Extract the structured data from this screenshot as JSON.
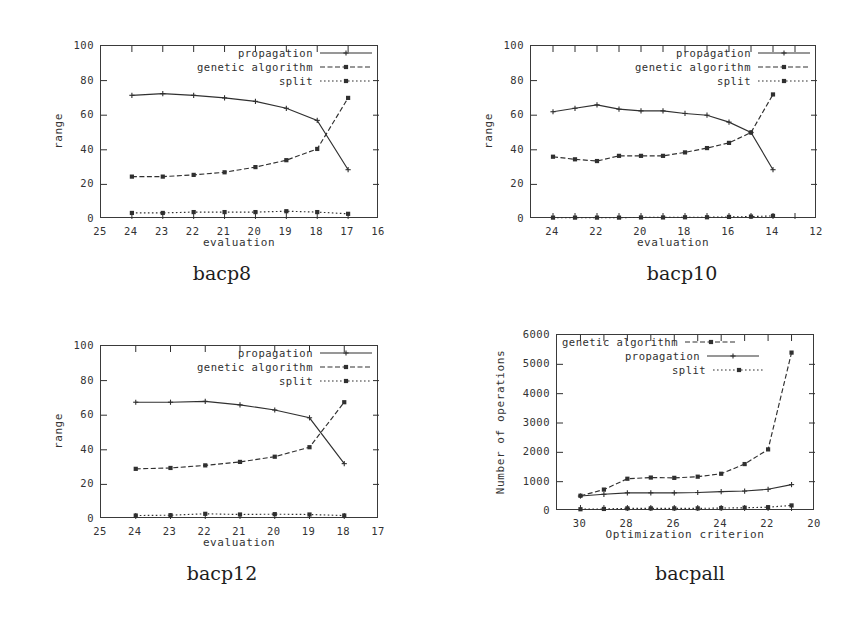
{
  "figure": {
    "background": "#ffffff",
    "ink": "#303030"
  },
  "series_styles": {
    "propagation": {
      "dash": "none",
      "marker": "plus"
    },
    "genetic algorithm": {
      "dash": "dashed",
      "marker": "square"
    },
    "split": {
      "dash": "dotted",
      "marker": "square"
    }
  },
  "panels": [
    {
      "id": "bacp8",
      "caption": "bacp8",
      "legend": [
        "propagation",
        "genetic algorithm",
        "split"
      ],
      "chart_data": {
        "type": "line",
        "title": "bacp8",
        "xlabel": "evaluation",
        "ylabel": "range",
        "xlim": [
          25,
          16
        ],
        "ylim": [
          0,
          100
        ],
        "xticks": [
          25,
          24,
          23,
          22,
          21,
          20,
          19,
          18,
          17,
          16
        ],
        "yticks": [
          0,
          20,
          40,
          60,
          80,
          100
        ],
        "x": [
          24,
          23,
          22,
          21,
          20,
          19,
          18,
          17
        ],
        "grid": false,
        "legend_position": "top-right",
        "series": [
          {
            "name": "propagation",
            "values": [
              71.5,
              72.5,
              71.5,
              70,
              68,
              64,
              57,
              28.5
            ]
          },
          {
            "name": "genetic algorithm",
            "values": [
              24.5,
              24.5,
              25.5,
              27,
              30,
              34,
              40.5,
              70
            ]
          },
          {
            "name": "split",
            "values": [
              3.5,
              3.5,
              4,
              4,
              4,
              4.5,
              4,
              3
            ]
          }
        ]
      }
    },
    {
      "id": "bacp10",
      "caption": "bacp10",
      "legend": [
        "propagation",
        "genetic algorithm",
        "split"
      ],
      "chart_data": {
        "type": "line",
        "title": "bacp10",
        "xlabel": "evaluation",
        "ylabel": "range",
        "xlim": [
          25,
          12
        ],
        "ylim": [
          0,
          100
        ],
        "xticks": [
          24,
          22,
          20,
          18,
          16,
          14,
          12
        ],
        "xtickminor": [
          25,
          23,
          21,
          19,
          17,
          15,
          13
        ],
        "yticks": [
          0,
          20,
          40,
          60,
          80,
          100
        ],
        "x": [
          24,
          23,
          22,
          21,
          20,
          19,
          18,
          17,
          16,
          15,
          14
        ],
        "grid": false,
        "legend_position": "top-right",
        "series": [
          {
            "name": "propagation",
            "values": [
              62,
              64,
              66,
              63.5,
              62.5,
              62.5,
              61,
              60,
              56,
              50,
              28.5
            ]
          },
          {
            "name": "genetic algorithm",
            "values": [
              36,
              34.5,
              33.5,
              36.5,
              36.5,
              36.5,
              38.5,
              41,
              44,
              50,
              72
            ]
          },
          {
            "name": "split",
            "values": [
              0.8,
              0.8,
              0.8,
              0.8,
              0.9,
              0.9,
              1,
              1,
              1.2,
              1.4,
              1.8
            ]
          }
        ]
      }
    },
    {
      "id": "bacp12",
      "caption": "bacp12",
      "legend": [
        "propagation",
        "genetic algorithm",
        "split"
      ],
      "chart_data": {
        "type": "line",
        "title": "bacp12",
        "xlabel": "evaluation",
        "ylabel": "range",
        "xlim": [
          25,
          17
        ],
        "ylim": [
          0,
          100
        ],
        "xticks": [
          25,
          24,
          23,
          22,
          21,
          20,
          19,
          18,
          17
        ],
        "yticks": [
          0,
          20,
          40,
          60,
          80,
          100
        ],
        "x": [
          24,
          23,
          22,
          21,
          20,
          19,
          18
        ],
        "grid": false,
        "legend_position": "top-right",
        "series": [
          {
            "name": "propagation",
            "values": [
              67.5,
              67.5,
              68,
              66,
              63,
              58.5,
              32
            ]
          },
          {
            "name": "genetic algorithm",
            "values": [
              29,
              29.5,
              31,
              33,
              36,
              41.5,
              67.5
            ]
          },
          {
            "name": "split",
            "values": [
              2,
              2.2,
              3,
              2.6,
              2.8,
              2.6,
              2
            ]
          }
        ]
      }
    },
    {
      "id": "bacpall",
      "caption": "bacpall",
      "legend": [
        "genetic algorithm",
        "propagation",
        "split"
      ],
      "chart_data": {
        "type": "line",
        "title": "bacpall",
        "xlabel": "Optimization criterion",
        "ylabel": "Number of operations",
        "xlim": [
          31,
          20
        ],
        "ylim": [
          0,
          6000
        ],
        "xticks": [
          30,
          28,
          26,
          24,
          22,
          20
        ],
        "xtickminor": [
          31,
          29,
          27,
          25,
          23,
          21
        ],
        "yticks": [
          0,
          1000,
          2000,
          3000,
          4000,
          5000,
          6000
        ],
        "x": [
          30,
          29,
          28,
          27,
          26,
          25,
          24,
          23,
          22,
          21
        ],
        "grid": false,
        "legend_position": "top-left",
        "series": [
          {
            "name": "genetic algorithm",
            "values": [
              520,
              730,
              1100,
              1140,
              1130,
              1170,
              1270,
              1600,
              2100,
              5400
            ]
          },
          {
            "name": "propagation",
            "values": [
              510,
              570,
              620,
              620,
              620,
              630,
              660,
              680,
              740,
              900
            ]
          },
          {
            "name": "split",
            "values": [
              60,
              70,
              90,
              90,
              90,
              90,
              100,
              110,
              130,
              190
            ]
          }
        ]
      }
    }
  ]
}
